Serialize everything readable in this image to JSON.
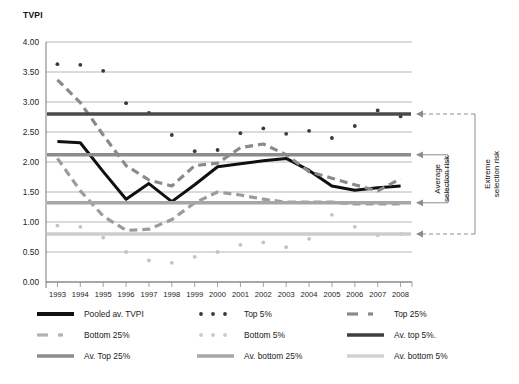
{
  "chart_data": {
    "type": "line",
    "title": "",
    "ylabel": "TVPI",
    "xlabel": "",
    "ylim": [
      0.0,
      4.0
    ],
    "ytick_step": 0.5,
    "ytick_labels": [
      "0.00",
      "0.50",
      "1.00",
      "1.50",
      "2.00",
      "2.50",
      "3.00",
      "3.50",
      "4.00"
    ],
    "grid": true,
    "legend_position": "bottom",
    "categories": [
      1993,
      1994,
      1995,
      1996,
      1997,
      1998,
      1999,
      2000,
      2001,
      2002,
      2003,
      2004,
      2005,
      2006,
      2007,
      2008
    ],
    "xtick_labels": [
      "1993",
      "1994",
      "1995",
      "1996",
      "1997",
      "1998",
      "1999",
      "2000",
      "2001",
      "2002",
      "2003",
      "2004",
      "2005",
      "2006",
      "2007",
      "2008"
    ],
    "series": [
      {
        "name": "Pooled av. TVPI",
        "style": "solid-thick",
        "color": "#101010",
        "values": [
          2.34,
          2.32,
          1.84,
          1.38,
          1.64,
          1.34,
          1.62,
          1.92,
          1.97,
          2.02,
          2.06,
          1.86,
          1.6,
          1.53,
          1.57,
          1.6
        ]
      },
      {
        "name": "Top 5%",
        "style": "dotted",
        "color": "#3a3a3a",
        "values": [
          3.63,
          3.62,
          3.52,
          2.98,
          2.82,
          2.45,
          2.18,
          2.2,
          2.48,
          2.56,
          2.47,
          2.52,
          2.4,
          2.6,
          2.86,
          2.76
        ]
      },
      {
        "name": "Top 25%",
        "style": "dashed",
        "color": "#8a8a8a",
        "values": [
          3.37,
          2.99,
          2.45,
          1.94,
          1.7,
          1.6,
          1.94,
          1.98,
          2.24,
          2.3,
          2.12,
          1.84,
          1.73,
          1.62,
          1.52,
          1.72
        ]
      },
      {
        "name": "Bottom 25%",
        "style": "dashed",
        "color": "#9c9c9c",
        "values": [
          2.06,
          1.52,
          1.1,
          0.86,
          0.88,
          1.04,
          1.32,
          1.5,
          1.45,
          1.38,
          1.33,
          1.33,
          1.33,
          1.3,
          1.3,
          1.3
        ]
      },
      {
        "name": "Bottom 5%",
        "style": "dotted",
        "color": "#c2c2c2",
        "values": [
          0.94,
          0.92,
          0.74,
          0.5,
          0.36,
          0.32,
          0.42,
          0.5,
          0.62,
          0.66,
          0.58,
          0.72,
          1.12,
          0.92,
          0.78,
          0.8
        ]
      },
      {
        "name": "Av. top 5%.",
        "style": "solid-flat",
        "color": "#4a4a4a",
        "value": 2.8
      },
      {
        "name": "Av. Top 25%",
        "style": "solid-flat",
        "color": "#8c8c8c",
        "value": 2.12
      },
      {
        "name": "Av. bottom 25%",
        "style": "solid-flat",
        "color": "#a6a6a6",
        "value": 1.32
      },
      {
        "name": "Av. bottom 5%",
        "style": "solid-flat",
        "color": "#cdcdcd",
        "value": 0.8
      }
    ],
    "annotations": [
      {
        "text": "Average selection risk",
        "points_to": [
          "Av. Top 25%",
          "Av. bottom 25%"
        ]
      },
      {
        "text": "Extreme selection risk",
        "points_to": [
          "Av. top 5%.",
          "Av. bottom 5%"
        ]
      }
    ]
  },
  "legend": {
    "items": [
      {
        "label": "Pooled av. TVPI",
        "style": "solid-thick",
        "color": "#101010"
      },
      {
        "label": "Top 5%",
        "style": "dotted",
        "color": "#3a3a3a"
      },
      {
        "label": "Top 25%",
        "style": "dashed",
        "color": "#8a8a8a"
      },
      {
        "label": "Bottom 25%",
        "style": "dashed",
        "color": "#b3b3b3"
      },
      {
        "label": "Bottom 5%",
        "style": "dotted",
        "color": "#c9c9c9"
      },
      {
        "label": "Av. top 5%.",
        "style": "solid-flat",
        "color": "#3f3f3f"
      },
      {
        "label": "Av. Top 25%",
        "style": "solid-flat",
        "color": "#8c8c8c"
      },
      {
        "label": "Av. bottom 25%",
        "style": "solid-flat",
        "color": "#a6a6a6"
      },
      {
        "label": "Av. bottom 5%",
        "style": "solid-flat",
        "color": "#d2d2d2"
      }
    ]
  }
}
